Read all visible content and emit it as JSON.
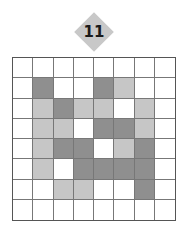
{
  "puzzle": {
    "number": "11",
    "colors": {
      "W": "#ffffff",
      "L": "#c6c6c6",
      "D": "#8f8f8f"
    },
    "grid": [
      [
        "W",
        "W",
        "W",
        "W",
        "W",
        "W",
        "W",
        "W"
      ],
      [
        "W",
        "D",
        "W",
        "W",
        "D",
        "L",
        "W",
        "W"
      ],
      [
        "W",
        "L",
        "D",
        "L",
        "L",
        "W",
        "L",
        "W"
      ],
      [
        "W",
        "L",
        "L",
        "W",
        "D",
        "D",
        "L",
        "W"
      ],
      [
        "W",
        "L",
        "D",
        "D",
        "W",
        "L",
        "D",
        "W"
      ],
      [
        "W",
        "L",
        "W",
        "D",
        "D",
        "D",
        "D",
        "W"
      ],
      [
        "W",
        "W",
        "L",
        "L",
        "W",
        "W",
        "D",
        "W"
      ],
      [
        "W",
        "W",
        "W",
        "W",
        "W",
        "W",
        "W",
        "W"
      ]
    ]
  }
}
